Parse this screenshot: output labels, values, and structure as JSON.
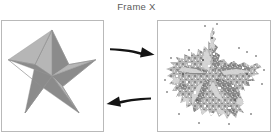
{
  "figure": {
    "title": "Frame X",
    "background_color": "#ffffff",
    "width": 273,
    "height": 137
  },
  "panels": [
    {
      "id": "original-star-panel",
      "label": "original star image",
      "border_color": "#b9b9b9",
      "background_color": "#ffffff",
      "content": "clean 3d five pointed star"
    },
    {
      "id": "degraded-star-panel",
      "label": "degraded star image",
      "border_color": "#b9b9b9",
      "background_color": "#ffffff",
      "content": "noisy quantized five pointed star"
    }
  ],
  "arrows": [
    {
      "id": "forward-arrow",
      "direction": "right",
      "color": "#141414",
      "label": ""
    },
    {
      "id": "backward-arrow",
      "direction": "left",
      "color": "#141414",
      "label": ""
    }
  ],
  "star": {
    "facet_light_color": "#b6b6b6",
    "facet_dark_color": "#8b8b8b",
    "facet_mid_color": "#a2a2a2",
    "edge_color": "#7d7d7d",
    "points": 5
  }
}
